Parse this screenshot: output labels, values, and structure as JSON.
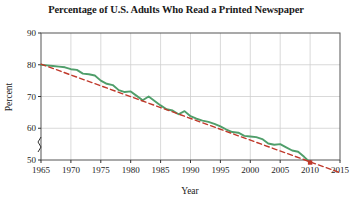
{
  "chart_data": {
    "type": "line",
    "title": "Percentage of U.S. Adults Who Read a Printed Newspaper",
    "xlabel": "Year",
    "ylabel": "Percent",
    "xlim": [
      1965,
      2015
    ],
    "ylim": [
      50,
      90
    ],
    "y_axis_break": true,
    "grid": true,
    "legend_position": "none",
    "xticks": [
      1965,
      1970,
      1975,
      1980,
      1985,
      1990,
      1995,
      2000,
      2005,
      2010,
      2015
    ],
    "xtick_labels": [
      "1965",
      "1970",
      "1975",
      "1980",
      "1985",
      "1990",
      "1995",
      "2000",
      "2005",
      "2010",
      "2015"
    ],
    "yticks": [
      50,
      60,
      70,
      80,
      90
    ],
    "ytick_labels": [
      "50",
      "60",
      "70",
      "80",
      "90"
    ],
    "series": [
      {
        "name": "Percent of U.S. adults who read a printed newspaper",
        "color": "#4f9e6a",
        "style": "solid",
        "x": [
          1965,
          1966,
          1967,
          1968,
          1969,
          1970,
          1971,
          1972,
          1973,
          1974,
          1975,
          1976,
          1977,
          1978,
          1979,
          1980,
          1981,
          1982,
          1983,
          1984,
          1985,
          1986,
          1987,
          1988,
          1989,
          1990,
          1991,
          1992,
          1993,
          1994,
          1995,
          1996,
          1997,
          1998,
          1999,
          2000,
          2001,
          2002,
          2003,
          2004,
          2005,
          2006,
          2007,
          2008,
          2009,
          2010
        ],
        "values": [
          80.0,
          79.8,
          79.6,
          79.4,
          79.2,
          78.6,
          78.4,
          77.2,
          77.0,
          76.6,
          75.0,
          74.0,
          73.6,
          72.0,
          71.4,
          71.6,
          70.2,
          68.8,
          70.0,
          68.6,
          67.2,
          66.0,
          65.6,
          64.4,
          65.4,
          63.8,
          63.0,
          62.4,
          62.0,
          61.4,
          60.6,
          59.6,
          58.8,
          58.6,
          57.6,
          57.4,
          57.2,
          56.6,
          55.2,
          54.8,
          55.0,
          54.0,
          53.0,
          52.6,
          51.0,
          49.2
        ]
      },
      {
        "name": "Linear trend line",
        "color": "#c0392b",
        "style": "dashed",
        "x": [
          1965,
          2015
        ],
        "values": [
          80.2,
          46.0
        ]
      }
    ],
    "markers": [
      {
        "x": 2010,
        "y": 49.2,
        "color": "#c0392b",
        "name": "trend-intersection-marker"
      }
    ]
  }
}
